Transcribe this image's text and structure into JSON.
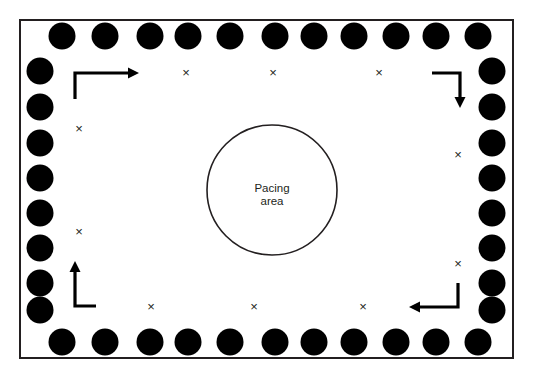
{
  "figure": {
    "type": "room-layout-diagram",
    "colors": {
      "chair_fill": "#000000",
      "border_stroke": "#231f20",
      "background": "#ffffff",
      "arrow": "#000000",
      "text": "#231f20"
    }
  },
  "room": {
    "label": "room-outline",
    "x": 20,
    "y": 20,
    "width": 493,
    "height": 338
  },
  "pacing_area": {
    "label": "Pacing area",
    "line1": "Pacing",
    "line2": "area",
    "cx": 272,
    "cy": 190,
    "r": 65
  },
  "chairs": {
    "name": "chair-dot",
    "radius": 13.5,
    "count_top": 11,
    "count_bottom": 11,
    "count_left": 9,
    "count_right": 9,
    "top_row": [
      {
        "cx": 62,
        "cy": 36
      },
      {
        "cx": 105,
        "cy": 36
      },
      {
        "cx": 150,
        "cy": 36
      },
      {
        "cx": 188,
        "cy": 36
      },
      {
        "cx": 230,
        "cy": 36
      },
      {
        "cx": 275,
        "cy": 36
      },
      {
        "cx": 314,
        "cy": 36
      },
      {
        "cx": 354,
        "cy": 36
      },
      {
        "cx": 396,
        "cy": 36
      },
      {
        "cx": 436,
        "cy": 36
      },
      {
        "cx": 478,
        "cy": 36
      }
    ],
    "bottom_row": [
      {
        "cx": 62,
        "cy": 342
      },
      {
        "cx": 105,
        "cy": 342
      },
      {
        "cx": 150,
        "cy": 342
      },
      {
        "cx": 188,
        "cy": 342
      },
      {
        "cx": 230,
        "cy": 342
      },
      {
        "cx": 275,
        "cy": 342
      },
      {
        "cx": 314,
        "cy": 342
      },
      {
        "cx": 354,
        "cy": 342
      },
      {
        "cx": 396,
        "cy": 342
      },
      {
        "cx": 436,
        "cy": 342
      },
      {
        "cx": 478,
        "cy": 342
      }
    ],
    "left_column": [
      {
        "cx": 40,
        "cy": 71
      },
      {
        "cx": 40,
        "cy": 107
      },
      {
        "cx": 40,
        "cy": 143
      },
      {
        "cx": 40,
        "cy": 178
      },
      {
        "cx": 40,
        "cy": 213
      },
      {
        "cx": 40,
        "cy": 248
      },
      {
        "cx": 40,
        "cy": 283
      },
      {
        "cx": 40,
        "cy": 310
      }
    ],
    "right_column": [
      {
        "cx": 492,
        "cy": 71
      },
      {
        "cx": 492,
        "cy": 107
      },
      {
        "cx": 492,
        "cy": 143
      },
      {
        "cx": 492,
        "cy": 178
      },
      {
        "cx": 492,
        "cy": 213
      },
      {
        "cx": 492,
        "cy": 248
      },
      {
        "cx": 492,
        "cy": 283
      },
      {
        "cx": 492,
        "cy": 310
      }
    ]
  },
  "x_markers": {
    "glyph": "×",
    "name": "x-marker",
    "positions": [
      {
        "x": 186,
        "y": 74,
        "region": "top"
      },
      {
        "x": 273,
        "y": 74,
        "region": "top"
      },
      {
        "x": 379,
        "y": 74,
        "region": "top"
      },
      {
        "x": 79,
        "y": 130,
        "region": "left"
      },
      {
        "x": 79,
        "y": 233,
        "region": "left"
      },
      {
        "x": 458,
        "y": 156,
        "region": "right"
      },
      {
        "x": 458,
        "y": 265,
        "region": "right"
      },
      {
        "x": 151,
        "y": 308,
        "region": "bottom"
      },
      {
        "x": 254,
        "y": 308,
        "region": "bottom"
      },
      {
        "x": 363,
        "y": 308,
        "region": "bottom"
      }
    ]
  },
  "flow_arrows": [
    {
      "name": "arrow-top-left-rightward",
      "direction": "right",
      "path": "M 75,99 L 75,73 L 131,73",
      "head": "139,73 128,67.5 128,78.5"
    },
    {
      "name": "arrow-top-right-downward",
      "direction": "down",
      "path": "M 432,73 L 460,73 L 460,97",
      "head": "460,108 454.5,97 465.5,97"
    },
    {
      "name": "arrow-bottom-left-upward",
      "direction": "up",
      "path": "M 96,306 L 75,306 L 75,272",
      "head": "75,261 69.5,272 80.5,272"
    },
    {
      "name": "arrow-bottom-right-leftward",
      "direction": "left",
      "path": "M 458,283 L 458,307 L 419,307",
      "head": "409,307 420,301.5 420,312.5"
    }
  ]
}
